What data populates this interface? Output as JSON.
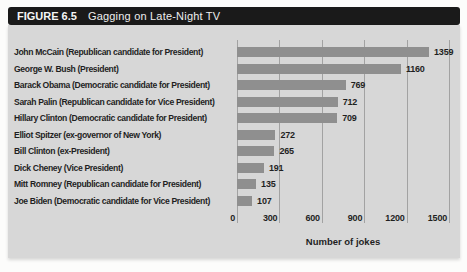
{
  "figure": {
    "label": "FIGURE 6.5",
    "title": "Gagging on Late-Night TV"
  },
  "chart_data": {
    "type": "bar",
    "orientation": "horizontal",
    "title": "Gagging on Late-Night TV",
    "categories": [
      "John McCain (Republican candidate for President)",
      "George W. Bush (President)",
      "Barack Obama (Democratic candidate for President)",
      "Sarah Palin (Republican candidate for Vice President)",
      "Hillary Clinton (Democratic candidate for President)",
      "Elliot Spitzer (ex-governor of New York)",
      "Bill Clinton (ex-President)",
      "Dick Cheney (Vice President)",
      "Mitt Romney (Republican candidate for President)",
      "Joe Biden (Democratic candidate for Vice President)"
    ],
    "values": [
      1359,
      1160,
      769,
      712,
      709,
      272,
      265,
      191,
      135,
      107
    ],
    "value_labels": [
      "1359",
      "1160",
      "769",
      "712",
      "709",
      "272",
      "265",
      "191",
      "135",
      "107"
    ],
    "xlabel": "Number of jokes",
    "xticks": [
      0,
      300,
      600,
      900,
      1200,
      1500
    ],
    "xlim": [
      0,
      1500
    ],
    "grid": true,
    "legend": false,
    "colors": {
      "bar": "#8f8f8f",
      "panel_background": "#d7d7d7",
      "header_background": "#1a1a1a",
      "header_text": "#f5f5f5",
      "text": "#1f1f1f"
    }
  }
}
